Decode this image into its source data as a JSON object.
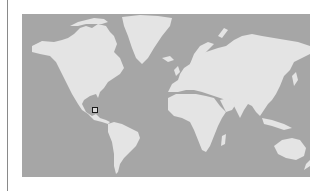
{
  "map": {
    "projection": "mercator",
    "colors": {
      "ocean": "#a6a6a6",
      "land": "#e4e4e4",
      "marker_border": "#1a1a1a",
      "rule": "#8a8a8a"
    },
    "marker": {
      "label": "Central America",
      "screen_x": 95,
      "screen_y": 110
    }
  }
}
